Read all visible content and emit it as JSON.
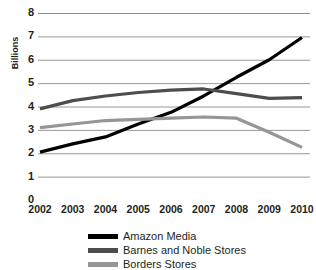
{
  "chart_data": {
    "type": "line",
    "title": "",
    "xlabel": "",
    "ylabel": "Billions",
    "x": [
      2002,
      2003,
      2004,
      2005,
      2006,
      2007,
      2008,
      2009,
      2010
    ],
    "categories": [
      "2002",
      "2003",
      "2004",
      "2005",
      "2006",
      "2007",
      "2008",
      "2009",
      "2010"
    ],
    "ylim": [
      0,
      8
    ],
    "ytick_labels": [
      "8",
      "7",
      "6",
      "5",
      "4",
      "3",
      "2",
      "1",
      "0"
    ],
    "yticks": [
      8,
      7,
      6,
      5,
      4,
      3,
      2,
      1,
      0
    ],
    "grid": true,
    "legend_position": "bottom",
    "series": [
      {
        "name": "Amazon Media",
        "color": "#000000",
        "values": [
          2.05,
          2.4,
          2.7,
          3.25,
          3.75,
          4.45,
          5.25,
          6.0,
          6.95
        ]
      },
      {
        "name": "Barnes and Noble Stores",
        "color": "#4d4d4d",
        "values": [
          3.9,
          4.25,
          4.45,
          4.6,
          4.7,
          4.75,
          4.55,
          4.35,
          4.38
        ]
      },
      {
        "name": "Borders Stores",
        "color": "#969696",
        "values": [
          3.1,
          3.25,
          3.4,
          3.45,
          3.5,
          3.55,
          3.5,
          2.9,
          2.25
        ]
      }
    ]
  },
  "legend": {
    "items": [
      {
        "label": "Amazon Media",
        "color": "#000000"
      },
      {
        "label": "Barnes and Noble Stores",
        "color": "#4d4d4d"
      },
      {
        "label": "Borders Stores",
        "color": "#969696"
      }
    ]
  },
  "axes": {
    "y_title": "Billions",
    "y_tick_labels": [
      "8",
      "7",
      "6",
      "5",
      "4",
      "3",
      "2",
      "1",
      "0"
    ],
    "x_tick_labels": [
      "2002",
      "2003",
      "2004",
      "2005",
      "2006",
      "2007",
      "2008",
      "2009",
      "2010"
    ]
  },
  "style": {
    "gridline_color": "#8c8c8c",
    "text_color": "#231f20",
    "background": "#ffffff"
  }
}
